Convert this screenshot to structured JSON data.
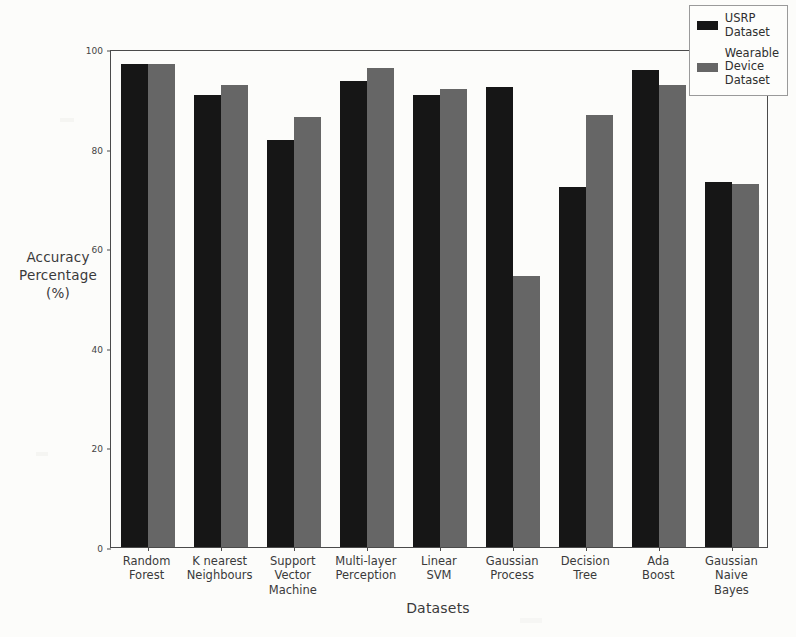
{
  "chart_data": {
    "type": "bar",
    "title": "",
    "xlabel": "Datasets",
    "ylabel": "Accuracy\nPercentage\n(%)",
    "ylim": [
      0,
      100
    ],
    "yticks": [
      0,
      20,
      40,
      60,
      80,
      100
    ],
    "grid": false,
    "legend_position": "upper right",
    "categories": [
      "Random\nForest",
      "K nearest\nNeighbours",
      "Support\nVector\nMachine",
      "Multi-layer\nPerception",
      "Linear\nSVM",
      "Gaussian\nProcess",
      "Decision\nTree",
      "Ada\nBoost",
      "Gaussian\nNaive\nBayes"
    ],
    "series": [
      {
        "name": "USRP\nDataset",
        "color": "#161616",
        "values": [
          97.0,
          90.8,
          81.8,
          93.5,
          90.8,
          92.4,
          72.3,
          95.8,
          73.2
        ]
      },
      {
        "name": "Wearable\nDevice\nDataset",
        "color": "#666666",
        "values": [
          97.0,
          92.8,
          86.4,
          96.2,
          92.0,
          54.4,
          86.8,
          92.8,
          72.9
        ]
      }
    ]
  },
  "legend": {
    "items": [
      {
        "label": "USRP\nDataset",
        "color": "#161616"
      },
      {
        "label": "Wearable\nDevice\nDataset",
        "color": "#666666"
      }
    ]
  },
  "axes": {
    "x_title": "Datasets",
    "y_title": "Accuracy\nPercentage\n(%)",
    "y_tick_labels": [
      "0",
      "20",
      "40",
      "60",
      "80",
      "100"
    ],
    "x_tick_labels": [
      "Random\nForest",
      "K nearest\nNeighbours",
      "Support\nVector\nMachine",
      "Multi-layer\nPerception",
      "Linear\nSVM",
      "Gaussian\nProcess",
      "Decision\nTree",
      "Ada\nBoost",
      "Gaussian\nNaive\nBayes"
    ]
  },
  "style": {
    "background": "#fcfcfa",
    "axis_color": "#4a4a4a",
    "text_color": "#3a3a3a"
  }
}
